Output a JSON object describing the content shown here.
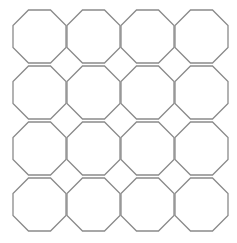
{
  "diagram": {
    "type": "octagon-grid",
    "rows": 4,
    "cols": 4,
    "origin_x": 13,
    "origin_y": 10,
    "pitch_x": 54,
    "pitch_y": 56,
    "size": 53,
    "stroke_color": "#8a8a8a",
    "fill_color": "#ffffff",
    "background": "#ffffff"
  }
}
